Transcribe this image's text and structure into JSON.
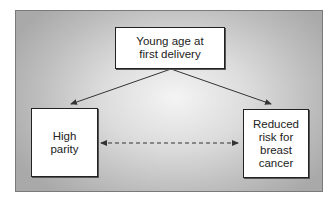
{
  "diagram": {
    "type": "causal-relationship",
    "background": {
      "center_color": "#f4f4f4",
      "edge_color": "#a9a9a9"
    },
    "nodes": [
      {
        "id": "young-age",
        "label": "Young age at\nfirst delivery",
        "position": "top"
      },
      {
        "id": "high-parity",
        "label": "High\nparity",
        "position": "bottom-left"
      },
      {
        "id": "reduced-risk",
        "label": "Reduced\nrisk for\nbreast\ncancer",
        "position": "bottom-right"
      }
    ],
    "edges": [
      {
        "from": "young-age",
        "to": "high-parity",
        "style": "solid",
        "direction": "forward"
      },
      {
        "from": "young-age",
        "to": "reduced-risk",
        "style": "solid",
        "direction": "forward"
      },
      {
        "from": "high-parity",
        "to": "reduced-risk",
        "style": "dashed",
        "direction": "bidirectional"
      }
    ],
    "colors": {
      "line": "#333333",
      "box_fill": "#ffffff",
      "box_border": "#222222",
      "text": "#222222"
    }
  }
}
